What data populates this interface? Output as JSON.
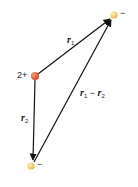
{
  "diagram": {
    "central_charge": {
      "label": "2+",
      "color": "#e0633a"
    },
    "charge_top": {
      "label": "−",
      "color": "#f0cf6a"
    },
    "charge_bottom": {
      "label": "−",
      "color": "#f0cf6a"
    },
    "vectors": [
      {
        "name": "r",
        "sub": "1",
        "from": "central_charge",
        "to": "charge_top"
      },
      {
        "name": "r",
        "sub": "2",
        "from": "central_charge",
        "to": "charge_bottom"
      },
      {
        "name": "r",
        "sub": "1",
        "minus": " − ",
        "name2": "r",
        "sub2": "2",
        "from": "charge_bottom",
        "to": "charge_top"
      }
    ]
  }
}
